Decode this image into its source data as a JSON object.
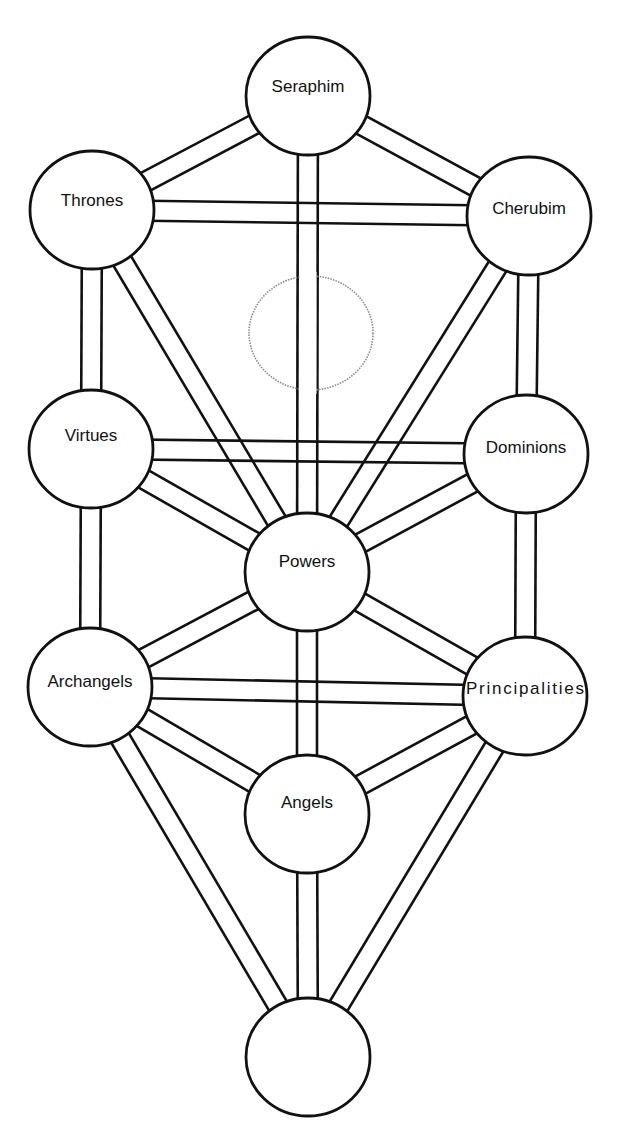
{
  "diagram": {
    "type": "tree-of-life",
    "colors": {
      "stroke": "#111111",
      "background": "#ffffff",
      "hidden_node": "#8a8a8a"
    },
    "node_radius": {
      "rx": 62,
      "ry": 59
    },
    "path_half_width": 10,
    "nodes": [
      {
        "id": "seraphim",
        "label": "Seraphim",
        "x": 308,
        "y": 96,
        "label_dy": -8
      },
      {
        "id": "thrones",
        "label": "Thrones",
        "x": 92,
        "y": 210,
        "label_dy": -8
      },
      {
        "id": "cherubim",
        "label": "Cherubim",
        "x": 529,
        "y": 216,
        "label_dy": -6
      },
      {
        "id": "virtues",
        "label": "Virtues",
        "x": 91,
        "y": 449,
        "label_dy": -12
      },
      {
        "id": "dominions",
        "label": "Dominions",
        "x": 526,
        "y": 454,
        "label_dy": -5
      },
      {
        "id": "powers",
        "label": "Powers",
        "x": 307,
        "y": 572,
        "label_dy": -9
      },
      {
        "id": "archangels",
        "label": "Archangels",
        "x": 90,
        "y": 687,
        "label_dy": -4
      },
      {
        "id": "principalities",
        "label": "Principalities",
        "x": 525,
        "y": 696,
        "label_dy": -6
      },
      {
        "id": "angels",
        "label": "Angels",
        "x": 307,
        "y": 814,
        "label_dy": -10
      },
      {
        "id": "bottom",
        "label": "",
        "x": 308,
        "y": 1057,
        "label_dy": 0
      }
    ],
    "hidden_node": {
      "id": "hidden",
      "x": 311,
      "y": 333,
      "rx": 62,
      "ry": 57
    },
    "paths": [
      [
        "seraphim",
        "thrones"
      ],
      [
        "seraphim",
        "cherubim"
      ],
      [
        "seraphim",
        "powers"
      ],
      [
        "thrones",
        "cherubim"
      ],
      [
        "thrones",
        "virtues"
      ],
      [
        "thrones",
        "powers"
      ],
      [
        "cherubim",
        "dominions"
      ],
      [
        "cherubim",
        "powers"
      ],
      [
        "virtues",
        "dominions"
      ],
      [
        "virtues",
        "powers"
      ],
      [
        "virtues",
        "archangels"
      ],
      [
        "dominions",
        "powers"
      ],
      [
        "dominions",
        "principalities"
      ],
      [
        "powers",
        "archangels"
      ],
      [
        "powers",
        "principalities"
      ],
      [
        "powers",
        "angels"
      ],
      [
        "archangels",
        "principalities"
      ],
      [
        "archangels",
        "angels"
      ],
      [
        "archangels",
        "bottom"
      ],
      [
        "principalities",
        "angels"
      ],
      [
        "principalities",
        "bottom"
      ],
      [
        "angels",
        "bottom"
      ]
    ]
  }
}
